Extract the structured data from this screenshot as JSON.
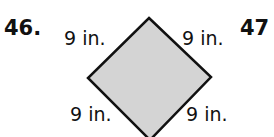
{
  "problem_numbers": {
    "current": "46.",
    "next": "47"
  },
  "figure": {
    "shape": "rhombus",
    "fill_color": "#d4d4d4",
    "stroke_color": "#111111",
    "side_labels": {
      "top_left": "9 in.",
      "top_right": "9 in.",
      "bottom_left": "9 in.",
      "bottom_right": "9 in."
    }
  }
}
